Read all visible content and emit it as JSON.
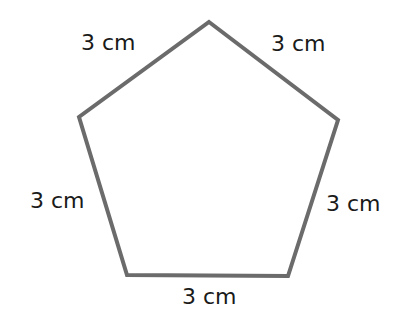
{
  "diagram": {
    "shape": "regular pentagon",
    "stroke_color": "#6b6b6b",
    "vertices": [
      [
        209,
        22
      ],
      [
        338,
        120
      ],
      [
        288,
        276
      ],
      [
        127,
        275
      ],
      [
        79,
        117
      ]
    ],
    "side_labels": [
      {
        "text": "3 cm",
        "side": "top-left"
      },
      {
        "text": "3 cm",
        "side": "top-right"
      },
      {
        "text": "3 cm",
        "side": "left"
      },
      {
        "text": "3 cm",
        "side": "right"
      },
      {
        "text": "3 cm",
        "side": "bottom"
      }
    ]
  }
}
